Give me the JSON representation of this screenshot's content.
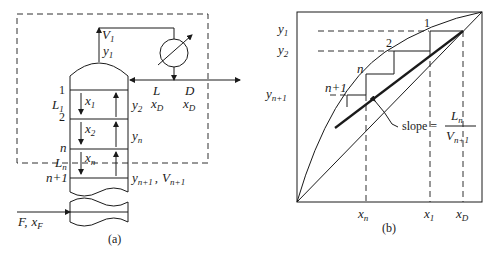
{
  "panel_a": {
    "caption": "(a)",
    "labels": {
      "V1": {
        "main": "V",
        "sub": "1"
      },
      "y1": {
        "main": "y",
        "sub": "1"
      },
      "L_reflux": "L",
      "xD_reflux": {
        "main": "x",
        "sub": "D"
      },
      "D": "D",
      "xD_product": {
        "main": "x",
        "sub": "D"
      },
      "tray1": "1",
      "L1": {
        "main": "L",
        "sub": "1"
      },
      "tray2": "2",
      "x1": {
        "main": "x",
        "sub": "1"
      },
      "y2": {
        "main": "y",
        "sub": "2"
      },
      "x2": {
        "main": "x",
        "sub": "2"
      },
      "yn": {
        "main": "y",
        "sub": "n"
      },
      "trayn": "n",
      "xn": {
        "main": "x",
        "sub": "n"
      },
      "Ln": {
        "main": "L",
        "sub": "n"
      },
      "trayn1": "n+1",
      "yn1": {
        "main": "y",
        "sub": "n+1"
      },
      "Vn1": {
        "main": "V",
        "sub": "n+1"
      },
      "feed": {
        "F": "F,",
        "x": "x",
        "sub": "F"
      }
    }
  },
  "panel_b": {
    "caption": "(b)",
    "y_labels": [
      {
        "main": "y",
        "sub": "1"
      },
      {
        "main": "y",
        "sub": "2"
      },
      {
        "main": "y",
        "sub": "n+1"
      }
    ],
    "x_labels": [
      {
        "main": "x",
        "sub": "n"
      },
      {
        "main": "x",
        "sub": "1"
      },
      {
        "main": "x",
        "sub": "D"
      }
    ],
    "stage_labels": [
      "1",
      "2",
      "n",
      "n+1"
    ],
    "slope": {
      "text": "slope =",
      "numerator": {
        "main": "L",
        "sub": "n"
      },
      "denominator": {
        "main": "V",
        "sub": "n+1"
      }
    }
  }
}
